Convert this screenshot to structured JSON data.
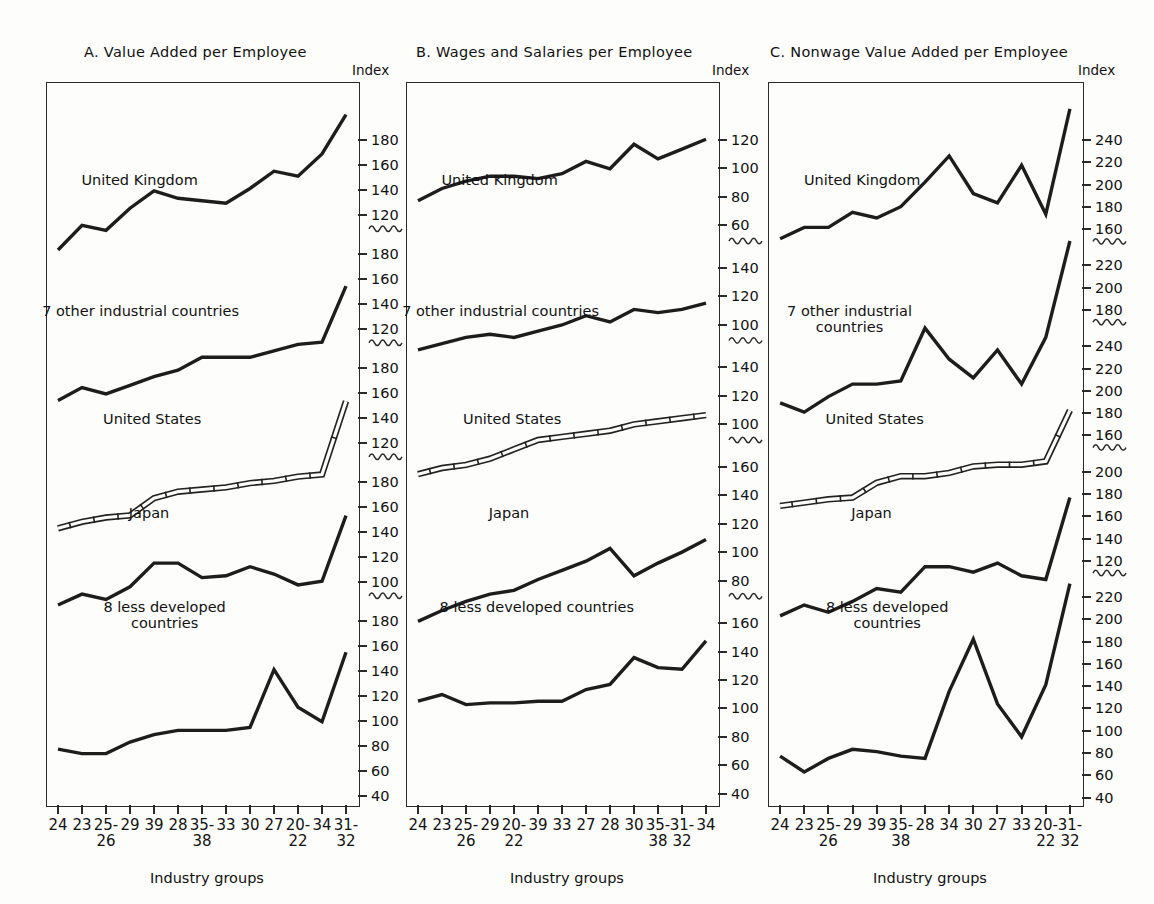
{
  "figure": {
    "index_label": "Index",
    "axis_title": "Industry groups"
  },
  "panels": [
    {
      "id": "A",
      "title": "A.  Value Added per Employee",
      "x_categories": [
        "24",
        "23",
        "25-\n26",
        "29",
        "39",
        "28",
        "35-\n38",
        "33",
        "30",
        "27",
        "20-\n22",
        "34",
        "31-\n32"
      ],
      "y_segments": [
        {
          "labels": [
            "180",
            "160",
            "140",
            "120"
          ]
        },
        {
          "labels": [
            "180",
            "160",
            "140",
            "120"
          ]
        },
        {
          "labels": [
            "180",
            "160",
            "140",
            "120"
          ]
        },
        {
          "labels": [
            "180",
            "160",
            "140",
            "120",
            "100"
          ]
        },
        {
          "labels": [
            "180",
            "160",
            "140",
            "120",
            "100",
            "80",
            "60",
            "40"
          ]
        }
      ],
      "series": [
        {
          "name": "United Kingdom",
          "style": "solid"
        },
        {
          "name": "7 other industrial countries",
          "style": "solid"
        },
        {
          "name": "United States",
          "style": "double"
        },
        {
          "name": "Japan",
          "style": "solid"
        },
        {
          "name": "8 less developed\ncountries",
          "style": "solid"
        }
      ]
    },
    {
      "id": "B",
      "title": "B.  Wages and Salaries per Employee",
      "x_categories": [
        "24",
        "23",
        "25-\n26",
        "29",
        "20-\n22",
        "39",
        "33",
        "27",
        "28",
        "30",
        "35-\n38",
        "31-\n32",
        "34"
      ],
      "y_segments": [
        {
          "labels": [
            "120",
            "100",
            "80",
            "60"
          ]
        },
        {
          "labels": [
            "140",
            "120",
            "100"
          ]
        },
        {
          "labels": [
            "140",
            "120",
            "100"
          ]
        },
        {
          "labels": [
            "160",
            "140",
            "120",
            "100",
            "80"
          ]
        },
        {
          "labels": [
            "160",
            "140",
            "120",
            "100",
            "80",
            "60",
            "40"
          ]
        }
      ],
      "series": [
        {
          "name": "United Kingdom",
          "style": "solid"
        },
        {
          "name": "7 other industrial countries",
          "style": "solid"
        },
        {
          "name": "United States",
          "style": "double"
        },
        {
          "name": "Japan",
          "style": "solid"
        },
        {
          "name": "8 less developed countries",
          "style": "solid"
        }
      ]
    },
    {
      "id": "C",
      "title": "C.  Nonwage Value Added per Employee",
      "x_categories": [
        "24",
        "23",
        "25-\n26",
        "29",
        "39",
        "35-\n38",
        "28",
        "34",
        "30",
        "27",
        "33",
        "20-\n22",
        "31-\n32"
      ],
      "y_segments": [
        {
          "labels": [
            "240",
            "220",
            "200",
            "180",
            "160"
          ]
        },
        {
          "labels": [
            "220",
            "200",
            "180"
          ]
        },
        {
          "labels": [
            "240",
            "220",
            "200",
            "180",
            "160"
          ]
        },
        {
          "labels": [
            "200",
            "180",
            "160",
            "140",
            "120"
          ]
        },
        {
          "labels": [
            "220",
            "200",
            "180",
            "160",
            "140",
            "120",
            "100",
            "80",
            "60",
            "40"
          ]
        }
      ],
      "series": [
        {
          "name": "United Kingdom",
          "style": "solid"
        },
        {
          "name": "7 other industrial\ncountries",
          "style": "solid"
        },
        {
          "name": "United States",
          "style": "double"
        },
        {
          "name": "Japan",
          "style": "solid"
        },
        {
          "name": "8 less developed\ncountries",
          "style": "solid"
        }
      ]
    }
  ],
  "chart_data": {
    "type": "line",
    "xlabel": "Industry groups",
    "ylabel": "Index",
    "grid": false,
    "legend": "inline-labels",
    "note": "Each panel stacks five separate series, each on its own broken index scale segment. Values below are read off each series' own scale segment.",
    "panels": [
      {
        "id": "A",
        "title": "A.  Value Added per Employee",
        "categories": [
          "24",
          "23",
          "25-26",
          "29",
          "39",
          "28",
          "35-38",
          "33",
          "30",
          "27",
          "20-22",
          "34",
          "31-32"
        ],
        "series": [
          {
            "name": "United Kingdom",
            "ylim": [
              120,
              185
            ],
            "values": [
              133,
              143,
              141,
              150,
              157,
              154,
              153,
              152,
              158,
              165,
              163,
              172,
              188
            ]
          },
          {
            "name": "7 other industrial countries",
            "ylim": [
              120,
              185
            ],
            "values": [
              137,
              143,
              140,
              144,
              148,
              151,
              157,
              157,
              157,
              160,
              163,
              164,
              190
            ]
          },
          {
            "name": "United States",
            "ylim": [
              120,
              185
            ],
            "values": [
              131,
              134,
              136,
              137,
              145,
              148,
              149,
              150,
              152,
              153,
              155,
              156,
              190
            ]
          },
          {
            "name": "Japan",
            "ylim": [
              100,
              185
            ],
            "values": [
              134,
              140,
              137,
              144,
              157,
              157,
              149,
              150,
              155,
              151,
              145,
              147,
              183
            ]
          },
          {
            "name": "8 less developed countries",
            "ylim": [
              40,
              185
            ],
            "values": [
              73,
              70,
              70,
              78,
              83,
              86,
              86,
              86,
              88,
              128,
              102,
              92,
              140
            ]
          }
        ]
      },
      {
        "id": "B",
        "title": "B.  Wages and Salaries per Employee",
        "categories": [
          "24",
          "23",
          "25-26",
          "29",
          "20-22",
          "39",
          "33",
          "27",
          "28",
          "30",
          "35-38",
          "31-32",
          "34"
        ],
        "series": [
          {
            "name": "United Kingdom",
            "ylim": [
              60,
              125
            ],
            "values": [
              93,
              98,
              101,
              103,
              103,
              102,
              104,
              109,
              106,
              116,
              110,
              114,
              118
            ]
          },
          {
            "name": "7 other industrial countries",
            "ylim": [
              100,
              145
            ],
            "values": [
              128,
              130,
              132,
              133,
              132,
              134,
              136,
              139,
              137,
              141,
              140,
              141,
              143
            ]
          },
          {
            "name": "United States",
            "ylim": [
              100,
              145
            ],
            "values": [
              125,
              127,
              128,
              130,
              133,
              136,
              137,
              138,
              139,
              141,
              142,
              143,
              144
            ]
          },
          {
            "name": "Japan",
            "ylim": [
              80,
              165
            ],
            "values": [
              105,
              111,
              116,
              120,
              122,
              128,
              133,
              138,
              145,
              130,
              137,
              143,
              150
            ]
          },
          {
            "name": "8 less developed countries",
            "ylim": [
              40,
              165
            ],
            "values": [
              97,
              101,
              95,
              96,
              96,
              97,
              97,
              104,
              107,
              123,
              117,
              116,
              133
            ]
          }
        ]
      },
      {
        "id": "C",
        "title": "C.  Nonwage Value Added per Employee",
        "categories": [
          "24",
          "23",
          "25-26",
          "29",
          "39",
          "35-38",
          "28",
          "34",
          "30",
          "27",
          "33",
          "20-22",
          "31-32"
        ],
        "series": [
          {
            "name": "United Kingdom",
            "ylim": [
              160,
              245
            ],
            "values": [
              183,
              189,
              189,
              197,
              194,
              200,
              213,
              227,
              207,
              202,
              222,
              196,
              252
            ]
          },
          {
            "name": "7 other industrial countries",
            "ylim": [
              180,
              225
            ],
            "values": [
              191,
              188,
              193,
              197,
              197,
              198,
              215,
              205,
              199,
              208,
              197,
              212,
              243
            ]
          },
          {
            "name": "United States",
            "ylim": [
              160,
              245
            ],
            "values": [
              188,
              190,
              192,
              193,
              202,
              206,
              206,
              208,
              212,
              213,
              213,
              215,
              246
            ]
          },
          {
            "name": "Japan",
            "ylim": [
              120,
              205
            ],
            "values": [
              148,
              154,
              150,
              156,
              163,
              161,
              175,
              175,
              172,
              177,
              170,
              168,
              213
            ]
          },
          {
            "name": "8 less developed countries",
            "ylim": [
              40,
              225
            ],
            "values": [
              76,
              62,
              74,
              82,
              80,
              76,
              74,
              133,
              179,
              122,
              93,
              139,
              228
            ]
          }
        ]
      }
    ]
  }
}
